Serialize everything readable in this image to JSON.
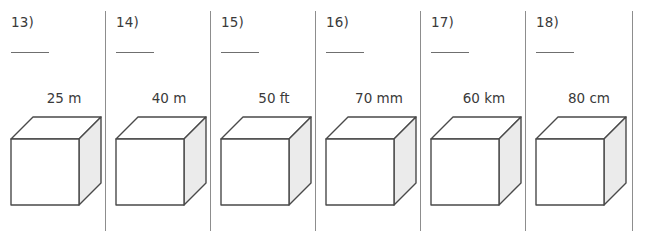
{
  "worksheet": {
    "background_color": "#ffffff",
    "line_color": "#8d8d8d",
    "ink_color": "#3a3a3a",
    "cube_stroke_color": "#4a4a4a",
    "cube_face_front_color": "#ffffff",
    "cube_face_top_color": "#ffffff",
    "cube_face_side_color": "#ebebeb",
    "problems": [
      {
        "number": "13)",
        "answer_blank": "",
        "dimension": "25 m"
      },
      {
        "number": "14)",
        "answer_blank": "",
        "dimension": "40 m"
      },
      {
        "number": "15)",
        "answer_blank": "",
        "dimension": "50 ft"
      },
      {
        "number": "16)",
        "answer_blank": "",
        "dimension": "70 mm"
      },
      {
        "number": "17)",
        "answer_blank": "",
        "dimension": "60 km"
      },
      {
        "number": "18)",
        "answer_blank": "",
        "dimension": "80 cm"
      }
    ]
  }
}
